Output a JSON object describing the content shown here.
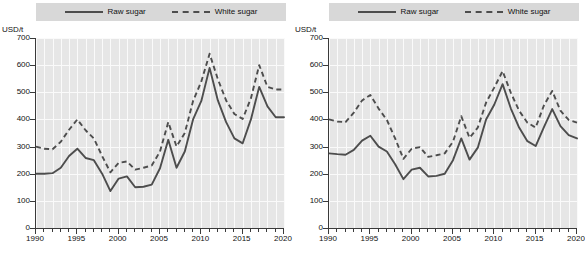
{
  "figure": {
    "panels": [
      {
        "id": "left-panel",
        "name": "sugar-prices-panel-left",
        "legend": {
          "raw_label": "Raw sugar",
          "white_label": "White sugar"
        },
        "chart_data": {
          "type": "line",
          "title": "",
          "subtitle": "",
          "xlabel": "",
          "ylabel": "USD/t",
          "yunit": "USD/t",
          "xlim": [
            1990,
            2020
          ],
          "ylim": [
            0,
            700
          ],
          "grid": true,
          "legend_position": "top-center",
          "xticks": [
            1990,
            1995,
            2000,
            2005,
            2010,
            2015,
            2020
          ],
          "xtick_labels": [
            "1990",
            "1995",
            "2000",
            "2005",
            "2010",
            "2015",
            "2020"
          ],
          "yticks": [
            0,
            100,
            200,
            300,
            400,
            500,
            600,
            700
          ],
          "ytick_labels": [
            "0",
            "100",
            "200",
            "300",
            "400",
            "500",
            "600",
            "700"
          ],
          "x": [
            1990,
            1991,
            1992,
            1993,
            1994,
            1995,
            1996,
            1997,
            1998,
            1999,
            2000,
            2001,
            2002,
            2003,
            2004,
            2005,
            2006,
            2007,
            2008,
            2009,
            2010,
            2011,
            2012,
            2013,
            2014,
            2015,
            2016,
            2017,
            2018,
            2019,
            2020
          ],
          "series": [
            {
              "name": "Raw sugar",
              "style": "solid",
              "color": "#4d4d4d",
              "values": [
                200,
                200,
                202,
                222,
                265,
                292,
                258,
                250,
                200,
                136,
                182,
                190,
                150,
                152,
                160,
                220,
                325,
                222,
                282,
                400,
                468,
                590,
                470,
                390,
                330,
                312,
                400,
                520,
                448,
                408,
                408
              ]
            },
            {
              "name": "White sugar",
              "style": "dashed",
              "color": "#4d4d4d",
              "values": [
                300,
                292,
                290,
                318,
                362,
                400,
                360,
                330,
                265,
                205,
                240,
                245,
                215,
                222,
                230,
                282,
                390,
                300,
                350,
                468,
                540,
                642,
                548,
                470,
                420,
                402,
                478,
                600,
                520,
                510,
                510
              ]
            }
          ]
        }
      },
      {
        "id": "right-panel",
        "name": "sugar-prices-panel-right",
        "legend": {
          "raw_label": "Raw sugar",
          "white_label": "White sugar"
        },
        "chart_data": {
          "type": "line",
          "title": "",
          "subtitle": "",
          "xlabel": "",
          "ylabel": "USD/t",
          "yunit": "USD/t",
          "xlim": [
            1990,
            2020
          ],
          "ylim": [
            0,
            700
          ],
          "grid": true,
          "legend_position": "top-center",
          "xticks": [
            1990,
            1995,
            2000,
            2005,
            2010,
            2015,
            2020
          ],
          "xtick_labels": [
            "1990",
            "1995",
            "2000",
            "2005",
            "2010",
            "2015",
            "2020"
          ],
          "yticks": [
            0,
            100,
            200,
            300,
            400,
            500,
            600,
            700
          ],
          "ytick_labels": [
            "0",
            "100",
            "200",
            "300",
            "400",
            "500",
            "600",
            "700"
          ],
          "x": [
            1990,
            1991,
            1992,
            1993,
            1994,
            1995,
            1996,
            1997,
            1998,
            1999,
            2000,
            2001,
            2002,
            2003,
            2004,
            2005,
            2006,
            2007,
            2008,
            2009,
            2010,
            2011,
            2012,
            2013,
            2014,
            2015,
            2016,
            2017,
            2018,
            2019,
            2020
          ],
          "series": [
            {
              "name": "Raw sugar",
              "style": "solid",
              "color": "#4d4d4d",
              "values": [
                275,
                272,
                270,
                288,
                322,
                340,
                300,
                282,
                235,
                180,
                215,
                222,
                190,
                192,
                200,
                250,
                330,
                252,
                296,
                400,
                455,
                530,
                440,
                370,
                320,
                302,
                372,
                438,
                375,
                342,
                330
              ]
            },
            {
              "name": "White sugar",
              "style": "dashed",
              "color": "#4d4d4d",
              "values": [
                400,
                392,
                390,
                425,
                470,
                490,
                440,
                398,
                330,
                255,
                292,
                298,
                262,
                268,
                275,
                318,
                412,
                332,
                370,
                462,
                518,
                578,
                498,
                432,
                388,
                370,
                452,
                505,
                432,
                398,
                388
              ]
            }
          ]
        }
      }
    ]
  }
}
